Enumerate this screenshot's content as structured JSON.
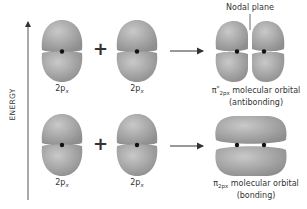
{
  "axis": {
    "label": "ENERGY"
  },
  "rows": [
    {
      "name": "antibonding",
      "atomic_orbitals": [
        {
          "label_main": "2p",
          "label_sub": "x"
        },
        {
          "label_main": "2p",
          "label_sub": "x"
        }
      ],
      "operator": "+",
      "result": {
        "symbol": "π",
        "superscript": "*",
        "subscript": "2px",
        "line1_rest": " molecular orbital",
        "line2": "(antibonding)",
        "annotation": "Nodal plane"
      }
    },
    {
      "name": "bonding",
      "atomic_orbitals": [
        {
          "label_main": "2p",
          "label_sub": "x"
        },
        {
          "label_main": "2p",
          "label_sub": "x"
        }
      ],
      "operator": "+",
      "result": {
        "symbol": "π",
        "subscript": "2px",
        "line1_rest": " molecular orbital",
        "line2": "(bonding)"
      }
    }
  ],
  "colors": {
    "lobe": "#9a9a9a",
    "lobe_light": "#c4c4c4",
    "nucleus": "#111111",
    "line": "#333333"
  }
}
